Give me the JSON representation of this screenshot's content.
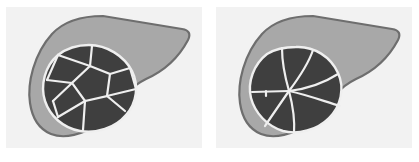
{
  "figure": {
    "title": "Liver tumour growth pattern comparison",
    "type": "two-panel anatomical schematic",
    "background_color": "#ffffff",
    "panel_background_color": "#f2f2f2",
    "liver_fill_color": "#a8a8a8",
    "liver_outline_color": "#6e6e6e",
    "tumor_fill_color": "#3f3f3f",
    "tumor_outline_color": "#efefef",
    "septa_color": "#efefef"
  },
  "panels": [
    {
      "id": "panel-left",
      "label": "",
      "organ": "liver",
      "lesion": {
        "name": "multinodular mass",
        "pattern": "multinodular",
        "pattern_description": "Dark tumour mass subdivided by pale septa into multiple irregular polygonal nodules, resembling a soccer-ball tessellation.",
        "nodule_count": 9,
        "center": {
          "x": 83,
          "y": 82
        },
        "radius_x": 46,
        "radius_y": 44
      }
    },
    {
      "id": "panel-right",
      "label": "",
      "organ": "liver",
      "lesion": {
        "name": "stellate mass",
        "pattern": "radial-stellate",
        "pattern_description": "Dark tumour mass crossed by pale septa radiating outward from a single central hub, producing a spoke-wheel or stellate scar appearance.",
        "spoke_count": 7,
        "center": {
          "x": 78,
          "y": 84
        },
        "radius_x": 46,
        "radius_y": 44
      }
    }
  ],
  "icons": {
    "liver_silhouette": "liver-silhouette-icon",
    "tumor_mass": "tumor-mass-icon"
  }
}
